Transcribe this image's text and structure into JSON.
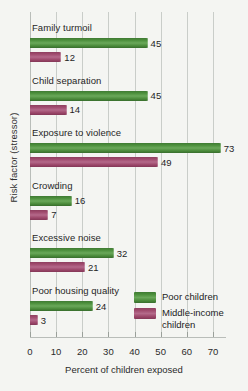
{
  "chart_data": {
    "type": "bar",
    "orientation": "horizontal",
    "title": "",
    "xlabel": "Percent of children exposed",
    "ylabel": "Risk factor (stressor)",
    "xlim": [
      0,
      75
    ],
    "xticks": [
      0,
      10,
      20,
      30,
      40,
      50,
      60,
      70
    ],
    "grid": true,
    "legend_position": "inside-bottom-right",
    "categories": [
      "Family turmoil",
      "Child separation",
      "Exposure to violence",
      "Crowding",
      "Excessive noise",
      "Poor housing quality"
    ],
    "series": [
      {
        "name": "Poor children",
        "color": "#4c8f3c",
        "values": [
          45,
          45,
          73,
          16,
          32,
          24
        ]
      },
      {
        "name": "Middle-income children",
        "color": "#a04b6e",
        "values": [
          12,
          14,
          49,
          7,
          21,
          3
        ]
      }
    ]
  },
  "axes": {
    "x_title": "Percent of children exposed",
    "y_title": "Risk factor (stressor)",
    "x_tick_labels": [
      "0",
      "10",
      "20",
      "30",
      "40",
      "50",
      "60",
      "70"
    ]
  },
  "groups": [
    {
      "label": "Family turmoil",
      "poor": "45",
      "middle": "12"
    },
    {
      "label": "Child separation",
      "poor": "45",
      "middle": "14"
    },
    {
      "label": "Exposure to violence",
      "poor": "73",
      "middle": "49"
    },
    {
      "label": "Crowding",
      "poor": "16",
      "middle": "7"
    },
    {
      "label": "Excessive noise",
      "poor": "32",
      "middle": "21"
    },
    {
      "label": "Poor housing quality",
      "poor": "24",
      "middle": "3"
    }
  ],
  "legend": {
    "poor_label": "Poor children",
    "middle_label": "Middle-income children"
  },
  "colors": {
    "poor": "#4c8f3c",
    "middle": "#a04b6e",
    "background": "#f4f5f2",
    "gridline": "#c9cdc9"
  }
}
